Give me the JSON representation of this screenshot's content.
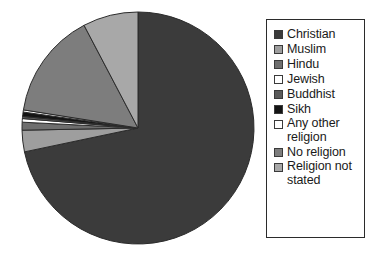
{
  "chart_data": {
    "type": "pie",
    "title": "",
    "subtitle": "",
    "xlabel": "",
    "ylabel": "",
    "grid": false,
    "legend_position": "right",
    "start_angle_deg": 0,
    "direction": "clockwise",
    "categories": [
      "Christian",
      "Muslim",
      "Hindu",
      "Jewish",
      "Buddhist",
      "Sikh",
      "Any other religion",
      "No religion",
      "Religion not stated"
    ],
    "values": [
      71.7,
      3.0,
      1.1,
      0.5,
      0.3,
      0.6,
      0.3,
      14.8,
      7.7
    ],
    "value_unit": "percent",
    "colors": [
      "#3b3b3b",
      "#9e9e9e",
      "#6e6e6e",
      "#ffffff",
      "#5a5a5a",
      "#141414",
      "#ffffff",
      "#7d7d7d",
      "#a8a8a8"
    ],
    "slice_stroke": "#2b2b2b",
    "series": [
      {
        "name": "Religion",
        "values": [
          71.7,
          3.0,
          1.1,
          0.5,
          0.3,
          0.6,
          0.3,
          14.8,
          7.7
        ]
      }
    ]
  },
  "legend": {
    "items": [
      {
        "label": "Christian",
        "color": "#3b3b3b"
      },
      {
        "label": "Muslim",
        "color": "#9e9e9e"
      },
      {
        "label": "Hindu",
        "color": "#6e6e6e"
      },
      {
        "label": "Jewish",
        "color": "#ffffff"
      },
      {
        "label": "Buddhist",
        "color": "#5a5a5a"
      },
      {
        "label": "Sikh",
        "color": "#141414"
      },
      {
        "label": "Any other religion",
        "color": "#ffffff"
      },
      {
        "label": "No religion",
        "color": "#7d7d7d"
      },
      {
        "label": "Religion not stated",
        "color": "#a8a8a8"
      }
    ]
  },
  "pie": {
    "center_x": 138,
    "center_y": 128,
    "radius": 116
  }
}
